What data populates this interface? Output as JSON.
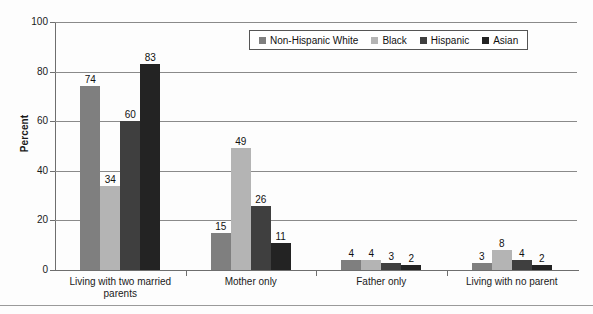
{
  "chart_data": {
    "type": "bar",
    "title": "",
    "xlabel": "",
    "ylabel": "Percent",
    "ylim": [
      0,
      100
    ],
    "yticks": [
      "0",
      "20",
      "40",
      "60",
      "80",
      "100"
    ],
    "grid": true,
    "legend_position": "top-right",
    "categories": [
      "Living with two married parents",
      "Mother only",
      "Father only",
      "Living with no parent"
    ],
    "category_lines": [
      [
        "Living with two married",
        "parents"
      ],
      [
        "Mother only"
      ],
      [
        "Father only"
      ],
      [
        "Living with no parent"
      ]
    ],
    "series": [
      {
        "name": "Non-Hispanic White",
        "color": "#7f7f7f",
        "values": [
          74,
          15,
          4,
          3
        ]
      },
      {
        "name": "Black",
        "color": "#b4b4b4",
        "values": [
          34,
          49,
          4,
          8
        ]
      },
      {
        "name": "Hispanic",
        "color": "#3f3f3f",
        "values": [
          60,
          26,
          3,
          4
        ]
      },
      {
        "name": "Asian",
        "color": "#232323",
        "values": [
          83,
          11,
          2,
          2
        ]
      }
    ]
  },
  "legend": {
    "items": [
      {
        "label": "Non-Hispanic White",
        "color": "#7f7f7f"
      },
      {
        "label": "Black",
        "color": "#b4b4b4"
      },
      {
        "label": "Hispanic",
        "color": "#3f3f3f"
      },
      {
        "label": "Asian",
        "color": "#232323"
      }
    ]
  }
}
